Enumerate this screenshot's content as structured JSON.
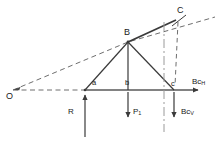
{
  "figure": {
    "type": "force-diagram",
    "background": "#ffffff",
    "stroke_solid": "#3a3a3a",
    "stroke_dashed": "#6e6e6e",
    "stroke_dashdot": "#8a8a8a",
    "text_color": "#1a1a1a",
    "width": 222,
    "height": 142
  },
  "points": {
    "O": {
      "label": "O",
      "x": 13,
      "y": 90
    },
    "a": {
      "label": "a",
      "x": 85,
      "y": 90
    },
    "b": {
      "label": "b",
      "x": 128,
      "y": 90
    },
    "c": {
      "label": "c",
      "x": 174,
      "y": 90
    },
    "B": {
      "label": "B",
      "x": 128,
      "y": 42
    },
    "C": {
      "label": "C",
      "x": 180,
      "y": 17
    }
  },
  "forces": [
    {
      "name": "reaction",
      "label": "R",
      "sub": "",
      "direction": "up",
      "x": 85,
      "y_tail": 137,
      "y_head": 93
    },
    {
      "name": "applied-load",
      "label": "P",
      "sub": "1",
      "direction": "down",
      "x": 128,
      "y_tail": 93,
      "y_head": 120
    },
    {
      "name": "bc-vertical",
      "label": "Bc",
      "sub": "V",
      "direction": "down",
      "x": 174,
      "y_tail": 93,
      "y_head": 120
    },
    {
      "name": "bc-horizontal",
      "label": "Bc",
      "sub": "H",
      "direction": "right",
      "y": 90,
      "x_tail": 174,
      "x_head": 202
    }
  ],
  "lines": {
    "baseline": {
      "style": "solid",
      "from": "a",
      "to": "arrow-right"
    },
    "ray-OC": {
      "style": "dashed",
      "from": "O",
      "to": "C-extended"
    },
    "ray-O-horizontal": {
      "style": "dashed",
      "from": "O",
      "to": "a"
    },
    "member-aB": {
      "style": "solid",
      "from": "a",
      "to": "B"
    },
    "member-Bc": {
      "style": "solid",
      "from": "B",
      "to": "c"
    },
    "member-Bb": {
      "style": "solid",
      "from": "B",
      "to": "b"
    },
    "reference-vertical": {
      "style": "dash-dot",
      "x": 164,
      "y_top": 22,
      "y_bottom": 132
    },
    "drop-C": {
      "style": "dashed",
      "from": "C",
      "to": "c"
    }
  },
  "labels": {
    "origin": "O",
    "apex": "B",
    "upper_right": "C",
    "node_a": "a",
    "node_b": "b",
    "node_c": "c",
    "reaction": "R",
    "load": "P",
    "load_sub": "1",
    "bc_horizontal": "Bc",
    "bc_horizontal_sub": "H",
    "bc_vertical": "Bc",
    "bc_vertical_sub": "V"
  }
}
